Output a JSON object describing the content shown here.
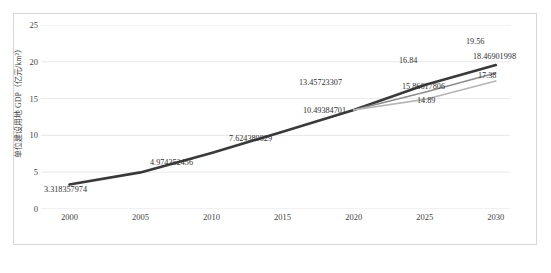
{
  "chart_data": {
    "type": "line",
    "title": "",
    "xlabel": "",
    "ylabel": "单位建设用地 GDP（亿元/km²）",
    "x": [
      2000,
      2005,
      2010,
      2015,
      2020,
      2025,
      2030
    ],
    "xlim": [
      1998,
      2031
    ],
    "ylim": [
      0,
      25
    ],
    "yticks": [
      0,
      5,
      10,
      15,
      20,
      25
    ],
    "xticks": [
      2000,
      2005,
      2010,
      2015,
      2020,
      2025,
      2030
    ],
    "grid": "horizontal",
    "legend": "none",
    "series": [
      {
        "name": "high",
        "color": "#3a3a3a",
        "width": 2.6,
        "x": [
          2000,
          2005,
          2010,
          2015,
          2020,
          2025,
          2030
        ],
        "values": [
          3.318357974,
          4.974352456,
          7.624389829,
          10.49384701,
          13.45723307,
          16.84,
          19.56
        ]
      },
      {
        "name": "mid",
        "color": "#8c8c8c",
        "width": 1.6,
        "x": [
          2020,
          2025,
          2030
        ],
        "values": [
          13.45723307,
          15.86617806,
          18.46901998
        ]
      },
      {
        "name": "low",
        "color": "#b5b5b5",
        "width": 1.6,
        "x": [
          2020,
          2025,
          2030
        ],
        "values": [
          13.45723307,
          14.89,
          17.38
        ]
      }
    ],
    "point_labels": [
      {
        "name": "label-2000",
        "text": "3.318357974",
        "left": 3,
        "top": 161
      },
      {
        "name": "label-2005",
        "text": "4.974352456",
        "left": 109,
        "top": 134
      },
      {
        "name": "label-2010",
        "text": "7.624389829",
        "left": 188,
        "top": 110
      },
      {
        "name": "label-2015",
        "text": "10.49384701",
        "left": 262,
        "top": 82
      },
      {
        "name": "label-2020",
        "text": "13.45723307",
        "left": 258,
        "top": 54
      },
      {
        "name": "label-2025-high",
        "text": "16.84",
        "left": 358,
        "top": 32
      },
      {
        "name": "label-2025-mid",
        "text": "15.86617806",
        "left": 361,
        "top": 58
      },
      {
        "name": "label-2025-low",
        "text": "14.89",
        "left": 376,
        "top": 72
      },
      {
        "name": "label-2030-high",
        "text": "19.56",
        "left": 425,
        "top": 13
      },
      {
        "name": "label-2030-mid",
        "text": "18.46901998",
        "left": 432,
        "top": 28
      },
      {
        "name": "label-2030-low",
        "text": "17.38",
        "left": 437,
        "top": 47
      }
    ]
  }
}
